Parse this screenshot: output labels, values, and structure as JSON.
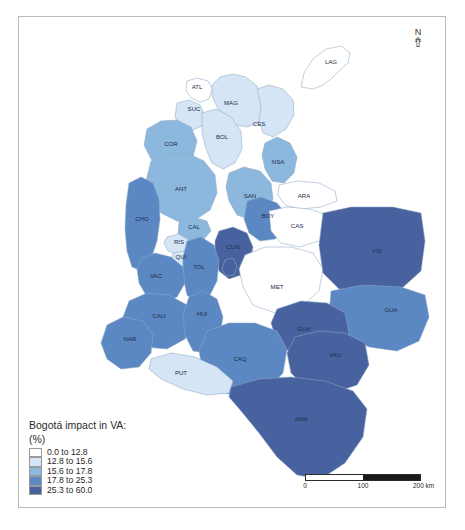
{
  "map": {
    "title_line1": "Bogotá impact in VA:",
    "title_line2": "(%)",
    "north_label": "N",
    "north_glyph": "⇮",
    "legend": [
      {
        "label": "0.0 to 12.8",
        "color": "#ffffff",
        "min": 0.0,
        "max": 12.8
      },
      {
        "label": "12.8 to 15.6",
        "color": "#d5e5f5",
        "min": 12.8,
        "max": 15.6
      },
      {
        "label": "15.6 to 17.8",
        "color": "#8cb8de",
        "min": 15.6,
        "max": 17.8
      },
      {
        "label": "17.8 to 25.3",
        "color": "#5b87c3",
        "min": 17.8,
        "max": 25.3
      },
      {
        "label": "25.3 to 60.0",
        "color": "#47629f",
        "min": 25.3,
        "max": 60.0
      }
    ],
    "scalebar": {
      "ticks": [
        "0",
        "100",
        "200 km"
      ],
      "segments": [
        "white",
        "white",
        "black",
        "black"
      ],
      "unit": "km",
      "max_value": 200
    },
    "regions": [
      {
        "code": "LAG",
        "class_index": 0,
        "label_x": 330,
        "label_y": 63
      },
      {
        "code": "ATL",
        "class_index": 0,
        "label_x": 196,
        "label_y": 88
      },
      {
        "code": "MAG",
        "class_index": 1,
        "label_x": 230,
        "label_y": 104
      },
      {
        "code": "CES",
        "class_index": 1,
        "label_x": 258,
        "label_y": 125
      },
      {
        "code": "SUC",
        "class_index": 1,
        "label_x": 193,
        "label_y": 110
      },
      {
        "code": "BOL",
        "class_index": 1,
        "label_x": 221,
        "label_y": 138
      },
      {
        "code": "COR",
        "class_index": 2,
        "label_x": 170,
        "label_y": 145
      },
      {
        "code": "NSA",
        "class_index": 2,
        "label_x": 277,
        "label_y": 163
      },
      {
        "code": "ANT",
        "class_index": 2,
        "label_x": 180,
        "label_y": 190
      },
      {
        "code": "SAN",
        "class_index": 2,
        "label_x": 249,
        "label_y": 197
      },
      {
        "code": "CHO",
        "class_index": 3,
        "label_x": 141,
        "label_y": 220
      },
      {
        "code": "BOY",
        "class_index": 3,
        "label_x": 267,
        "label_y": 217
      },
      {
        "code": "ARA",
        "class_index": 0,
        "label_x": 303,
        "label_y": 197
      },
      {
        "code": "CAS",
        "class_index": 0,
        "label_x": 296,
        "label_y": 227
      },
      {
        "code": "CAL",
        "class_index": 2,
        "label_x": 193,
        "label_y": 228
      },
      {
        "code": "RIS",
        "class_index": 1,
        "label_x": 178,
        "label_y": 243
      },
      {
        "code": "QUI",
        "class_index": 1,
        "label_x": 180,
        "label_y": 258
      },
      {
        "code": "CUN",
        "class_index": 4,
        "label_x": 232,
        "label_y": 248
      },
      {
        "code": "DC",
        "class_index": 4,
        "label_x": 228,
        "label_y": 266
      },
      {
        "code": "TOL",
        "class_index": 3,
        "label_x": 198,
        "label_y": 268
      },
      {
        "code": "VAC",
        "class_index": 3,
        "label_x": 155,
        "label_y": 277
      },
      {
        "code": "MET",
        "class_index": 0,
        "label_x": 276,
        "label_y": 288
      },
      {
        "code": "VID",
        "class_index": 4,
        "label_x": 376,
        "label_y": 252
      },
      {
        "code": "GUA",
        "class_index": 3,
        "label_x": 390,
        "label_y": 311
      },
      {
        "code": "CAU",
        "class_index": 3,
        "label_x": 158,
        "label_y": 317
      },
      {
        "code": "HUI",
        "class_index": 3,
        "label_x": 201,
        "label_y": 315
      },
      {
        "code": "NAR",
        "class_index": 3,
        "label_x": 129,
        "label_y": 340
      },
      {
        "code": "GUV",
        "class_index": 4,
        "label_x": 303,
        "label_y": 330
      },
      {
        "code": "CAQ",
        "class_index": 3,
        "label_x": 239,
        "label_y": 360
      },
      {
        "code": "VAU",
        "class_index": 4,
        "label_x": 334,
        "label_y": 356
      },
      {
        "code": "PUT",
        "class_index": 1,
        "label_x": 180,
        "label_y": 374
      },
      {
        "code": "AMA",
        "class_index": 4,
        "label_x": 300,
        "label_y": 420
      }
    ]
  }
}
